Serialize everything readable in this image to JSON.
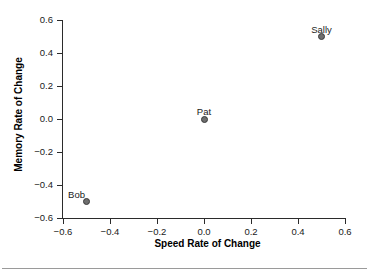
{
  "chart_data": {
    "type": "scatter",
    "title": "",
    "xlabel": "Speed Rate of Change",
    "ylabel": "Memory Rate of Change",
    "xlim": [
      -0.6,
      0.6
    ],
    "ylim": [
      -0.6,
      0.6
    ],
    "xticks": [
      "−0.6",
      "−0.4",
      "−0.2",
      "0.0",
      "0.2",
      "0.4",
      "0.6"
    ],
    "xtick_values": [
      -0.6,
      -0.4,
      -0.2,
      0.0,
      0.2,
      0.4,
      0.6
    ],
    "yticks": [
      "−0.6",
      "−0.4",
      "−0.2",
      "0.0",
      "0.2",
      "0.4",
      "0.6"
    ],
    "ytick_values": [
      -0.6,
      -0.4,
      -0.2,
      0.0,
      0.2,
      0.4,
      0.6
    ],
    "grid": false,
    "legend": "none",
    "marker_color": "#6e6e6e",
    "marker_edge_color": "#3a3a3a",
    "axis_color": "#2b2b2b",
    "points": [
      {
        "label": "Bob",
        "x": -0.5,
        "y": -0.5,
        "label_dx": -10,
        "label_dy": -13
      },
      {
        "label": "Pat",
        "x": 0.0,
        "y": 0.0,
        "label_dx": 0,
        "label_dy": -13
      },
      {
        "label": "Sally",
        "x": 0.5,
        "y": 0.5,
        "label_dx": 0,
        "label_dy": -13
      }
    ]
  }
}
